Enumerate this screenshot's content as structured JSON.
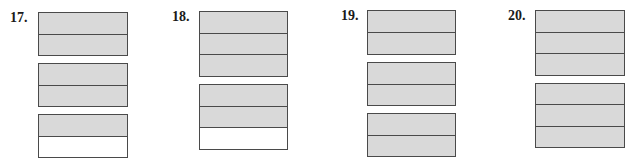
{
  "colors": {
    "shaded": "#d9d9d9",
    "unshaded": "#ffffff",
    "border": "#4a4a4a",
    "label": "#1a1a1a"
  },
  "problems": [
    {
      "number": "17.",
      "parts_per_whole": 2,
      "wholes": [
        {
          "shaded": [
            true,
            true
          ]
        },
        {
          "shaded": [
            true,
            true
          ]
        },
        {
          "shaded": [
            true,
            false
          ]
        }
      ]
    },
    {
      "number": "18.",
      "parts_per_whole": 3,
      "wholes": [
        {
          "shaded": [
            true,
            true,
            true
          ]
        },
        {
          "shaded": [
            true,
            true,
            false
          ]
        }
      ]
    },
    {
      "number": "19.",
      "parts_per_whole": 2,
      "wholes": [
        {
          "shaded": [
            true,
            true
          ]
        },
        {
          "shaded": [
            true,
            true
          ]
        },
        {
          "shaded": [
            true,
            true
          ]
        }
      ]
    },
    {
      "number": "20.",
      "parts_per_whole": 3,
      "wholes": [
        {
          "shaded": [
            true,
            true,
            true
          ]
        },
        {
          "shaded": [
            true,
            true,
            true
          ]
        }
      ]
    }
  ]
}
